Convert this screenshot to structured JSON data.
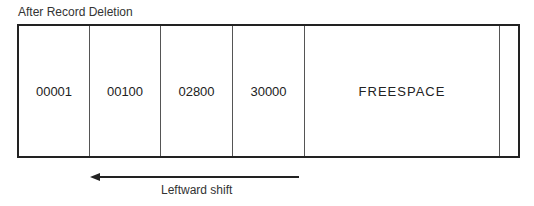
{
  "title": "After Record Deletion",
  "cells": [
    {
      "label": "00001",
      "width": 71
    },
    {
      "label": "00100",
      "width": 71
    },
    {
      "label": "02800",
      "width": 72
    },
    {
      "label": "30000",
      "width": 72
    },
    {
      "label": "FREESPACE",
      "width": 195
    },
    {
      "label": "",
      "width": 18
    }
  ],
  "arrow": {
    "direction": "left",
    "label": "Leftward shift"
  }
}
